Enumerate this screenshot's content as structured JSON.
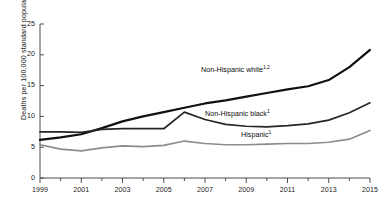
{
  "chart_data": {
    "type": "line",
    "title": "",
    "subtitle": "",
    "xlabel": "",
    "ylabel": "Deaths per 100,000 standard population",
    "xlim": [
      1999,
      2015
    ],
    "ylim": [
      0,
      25
    ],
    "yticks": [
      0,
      5,
      10,
      15,
      20,
      25
    ],
    "ytick_labels": [
      "0",
      "5",
      "10",
      "15",
      "20",
      "25"
    ],
    "xticks": [
      1999,
      2000,
      2001,
      2002,
      2003,
      2004,
      2005,
      2006,
      2007,
      2008,
      2009,
      2010,
      2011,
      2012,
      2013,
      2014,
      2015
    ],
    "xtick_labels_major": [
      "1999",
      "2001",
      "2003",
      "2005",
      "2007",
      "2009",
      "2011",
      "2013",
      "2015"
    ],
    "xticks_major": [
      1999,
      2001,
      2003,
      2005,
      2007,
      2009,
      2011,
      2013,
      2015
    ],
    "grid": false,
    "legend_position": "inline-annotations",
    "x": [
      1999,
      2000,
      2001,
      2002,
      2003,
      2004,
      2005,
      2006,
      2007,
      2008,
      2009,
      2010,
      2011,
      2012,
      2013,
      2014,
      2015
    ],
    "series": [
      {
        "name": "Non-Hispanic white",
        "footnotes": "1,2",
        "color": "#111111",
        "width": 2.2,
        "values": [
          6.2,
          6.6,
          7.1,
          8.1,
          9.2,
          10.0,
          10.7,
          11.4,
          12.1,
          12.6,
          13.2,
          13.8,
          14.4,
          14.9,
          15.9,
          18.0,
          20.8
        ]
      },
      {
        "name": "Non-Hispanic black",
        "footnotes": "1",
        "color": "#262626",
        "width": 1.7,
        "values": [
          7.5,
          7.5,
          7.4,
          7.9,
          8.0,
          8.0,
          8.0,
          10.7,
          9.5,
          8.7,
          8.4,
          8.3,
          8.5,
          8.8,
          9.4,
          10.6,
          12.2
        ]
      },
      {
        "name": "Hispanic",
        "footnotes": "1",
        "color": "#8c8c8c",
        "width": 1.7,
        "values": [
          5.4,
          4.7,
          4.4,
          4.9,
          5.2,
          5.1,
          5.3,
          6.0,
          5.6,
          5.4,
          5.4,
          5.5,
          5.6,
          5.6,
          5.8,
          6.3,
          7.7
        ]
      }
    ],
    "annotations": [
      {
        "text": "Non-Hispanic white",
        "footnotes": "1,2",
        "x_px": 201,
        "y_px": 65
      },
      {
        "text": "Non-Hispanic black",
        "footnotes": "1",
        "x_px": 205,
        "y_px": 109
      },
      {
        "text": "Hispanic",
        "footnotes": "1",
        "x_px": 241,
        "y_px": 130
      }
    ],
    "axis_color": "#4d4d4d",
    "plot_box": {
      "left": 40,
      "right": 370,
      "top": 24,
      "bottom": 178
    }
  }
}
